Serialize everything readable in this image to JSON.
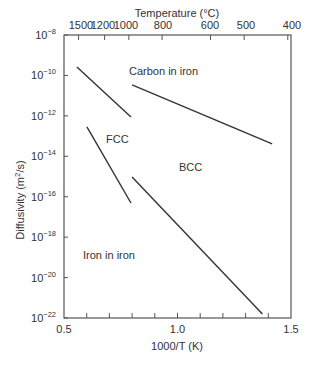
{
  "chart_data": {
    "type": "line",
    "title": "",
    "xlabel": "1000/T (K)",
    "ylabel": "Diffusivity (m²/s)",
    "top_axis_label": "Temperature (°C)",
    "xlim": [
      0.5,
      1.5
    ],
    "ylim_log10": [
      -22,
      -8
    ],
    "yscale": "log",
    "x_ticks": [
      "0.5",
      "1.0",
      "1.5"
    ],
    "y_ticks_exponents": [
      -8,
      -10,
      -12,
      -14,
      -16,
      -18,
      -20,
      -22
    ],
    "top_ticks": [
      "1500",
      "1200",
      "1000",
      "800",
      "600",
      "500",
      "400"
    ],
    "grid": false,
    "legend": "none",
    "annotations": [
      "Carbon in iron",
      "FCC",
      "BCC",
      "Iron in iron"
    ],
    "series": [
      {
        "name": "Carbon in iron (FCC)",
        "x": [
          0.557,
          0.795
        ],
        "log10_y": [
          -9.58,
          -12.06
        ]
      },
      {
        "name": "Carbon in iron (BCC)",
        "x": [
          0.8,
          1.417
        ],
        "log10_y": [
          -10.47,
          -13.39
        ]
      },
      {
        "name": "Iron in iron (FCC)",
        "x": [
          0.601,
          0.795
        ],
        "log10_y": [
          -12.55,
          -16.31
        ]
      },
      {
        "name": "Iron in iron (BCC)",
        "x": [
          0.8,
          1.374
        ],
        "log10_y": [
          -15.02,
          -21.8
        ]
      }
    ]
  },
  "labels": {
    "top_axis": "Temperature (°C)",
    "x_axis": "1000/T (K)",
    "y_axis_prefix": "Diffusivity (m",
    "y_axis_sup": "2",
    "y_axis_suffix": "/s)",
    "carbon": "Carbon in iron",
    "fcc": "FCC",
    "bcc": "BCC",
    "iron": "Iron in iron"
  }
}
